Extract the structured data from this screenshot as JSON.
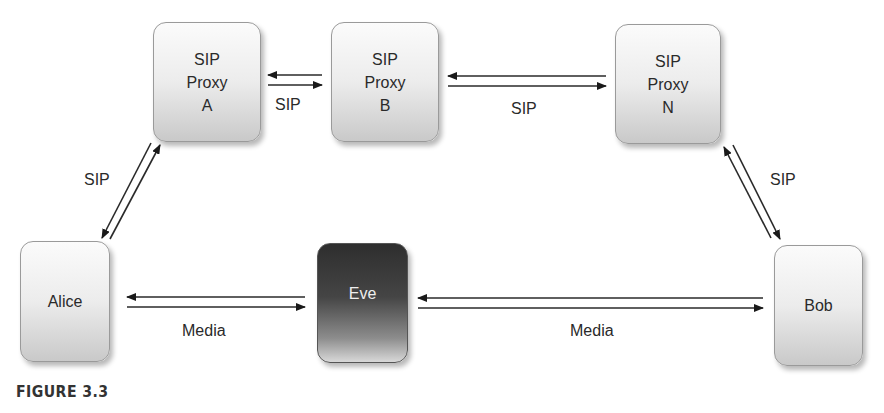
{
  "diagram": {
    "nodes": [
      {
        "id": "proxy_a",
        "lines": [
          "SIP",
          "Proxy",
          "A"
        ]
      },
      {
        "id": "proxy_b",
        "lines": [
          "SIP",
          "Proxy",
          "B"
        ]
      },
      {
        "id": "proxy_n",
        "lines": [
          "SIP",
          "Proxy",
          "N"
        ]
      },
      {
        "id": "alice",
        "label": "Alice"
      },
      {
        "id": "eve",
        "label": "Eve"
      },
      {
        "id": "bob",
        "label": "Bob"
      }
    ],
    "edges": [
      {
        "from": "proxy_a",
        "to": "proxy_b",
        "label": "SIP",
        "bidirectional": true
      },
      {
        "from": "proxy_b",
        "to": "proxy_n",
        "label": "SIP",
        "bidirectional": true
      },
      {
        "from": "alice",
        "to": "proxy_a",
        "label": "SIP",
        "bidirectional": true
      },
      {
        "from": "proxy_n",
        "to": "bob",
        "label": "SIP",
        "bidirectional": true
      },
      {
        "from": "alice",
        "to": "eve",
        "label": "Media",
        "bidirectional": true
      },
      {
        "from": "eve",
        "to": "bob",
        "label": "Media",
        "bidirectional": true
      }
    ],
    "caption": "FIGURE 3.3"
  }
}
